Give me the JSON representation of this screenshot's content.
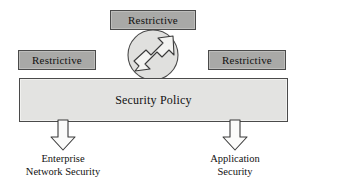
{
  "diagram": {
    "colors": {
      "restrictive_fill": "#a9a9a7",
      "policy_fill": "#e3e3e1",
      "outline": "#4a4a4a",
      "background": "#ffffff",
      "text": "#111111"
    },
    "restrictive_boxes": [
      {
        "id": "top",
        "label": "Restrictive"
      },
      {
        "id": "left",
        "label": "Restrictive"
      },
      {
        "id": "right",
        "label": "Restrictive"
      }
    ],
    "policy": {
      "label": "Security Policy"
    },
    "circular_arrow": {
      "icon_name": "circular-double-arrow-icon",
      "description": "semicircular arc enclosing a bent double-headed arrow"
    },
    "outputs": [
      {
        "id": "enterprise-network-security",
        "arrow_icon": "down-arrow-icon",
        "lines": [
          "Enterprise",
          "Network Security"
        ]
      },
      {
        "id": "application-security",
        "arrow_icon": "down-arrow-icon",
        "lines": [
          "Application",
          "Security"
        ]
      }
    ]
  }
}
